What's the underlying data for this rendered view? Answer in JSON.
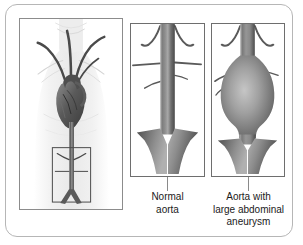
{
  "figure": {
    "style": "grayscale medical line drawing",
    "border_color": "#b6b6b6",
    "panel_border_color": "#6e6e6e",
    "vessel_color": "#6b6b6b",
    "text_color": "#1a1a1a"
  },
  "panels": [
    {
      "id": "torso",
      "name": "torso-with-heart-and-aorta",
      "caption": "",
      "contents": [
        "human torso outline",
        "heart",
        "aortic arch with three branch vessels",
        "descending aorta",
        "highlight box over abdominal aorta",
        "aortic bifurcation into iliac arteries"
      ]
    },
    {
      "id": "normal",
      "name": "normal-aorta",
      "caption_line_1": "Normal",
      "caption_line_2": "aorta",
      "caption_full": "Normal aorta",
      "contents": [
        "straight uniform-caliber aorta",
        "paired upper branch arteries",
        "renal arteries",
        "bifurcation into common iliac arteries"
      ]
    },
    {
      "id": "aneurysm",
      "name": "aorta-with-large-abdominal-aneurysm",
      "caption_line_1": "Aorta with",
      "caption_line_2": "large abdominal",
      "caption_line_3": "aneurysm",
      "caption_full": "Aorta with large abdominal aneurysm",
      "contents": [
        "aorta with large fusiform dilation",
        "paired upper branch arteries",
        "renal arteries",
        "bifurcation into common iliac arteries"
      ]
    }
  ]
}
